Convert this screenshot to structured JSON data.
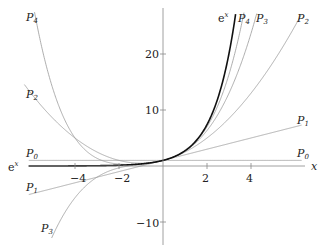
{
  "chart_data": {
    "type": "line",
    "title": "",
    "xlabel": "x",
    "ylabel": "",
    "xlim": [
      -6.1,
      6.3
    ],
    "ylim": [
      -12,
      29
    ],
    "grid": false,
    "legend": "inline labels at curve ends",
    "x_ticks": [
      -4,
      -2,
      2,
      4
    ],
    "y_ticks": [
      -10,
      10,
      20
    ],
    "series": [
      {
        "name": "e^x",
        "label": "eˣ",
        "color": "#111111",
        "width": 1.6,
        "fn": "exp"
      },
      {
        "name": "P0",
        "label": "P₀",
        "color": "#999999",
        "width": 0.8,
        "fn": "taylor",
        "order": 0
      },
      {
        "name": "P1",
        "label": "P₁",
        "color": "#999999",
        "width": 0.8,
        "fn": "taylor",
        "order": 1
      },
      {
        "name": "P2",
        "label": "P₂",
        "color": "#999999",
        "width": 0.8,
        "fn": "taylor",
        "order": 2
      },
      {
        "name": "P3",
        "label": "P₃",
        "color": "#999999",
        "width": 0.8,
        "fn": "taylor",
        "order": 3
      },
      {
        "name": "P4",
        "label": "P₄",
        "color": "#999999",
        "width": 0.8,
        "fn": "taylor",
        "order": 4
      }
    ],
    "annotations": [
      {
        "text": "P4",
        "at": "top-left"
      },
      {
        "text": "P2",
        "at": "left"
      },
      {
        "text": "P0",
        "at": "left and right"
      },
      {
        "text": "e^x",
        "at": "left and top"
      },
      {
        "text": "P1",
        "at": "left and right"
      },
      {
        "text": "P3",
        "at": "bottom-left and top"
      }
    ]
  },
  "labels": {
    "x_axis": "x",
    "tick_x": [
      "−4",
      "−2",
      "2",
      "4"
    ],
    "tick_y": [
      "20",
      "10",
      "−10"
    ],
    "ex": "e",
    "ex_sup": "x",
    "p": "P",
    "sub0": "0",
    "sub1": "1",
    "sub2": "2",
    "sub3": "3",
    "sub4": "4"
  }
}
